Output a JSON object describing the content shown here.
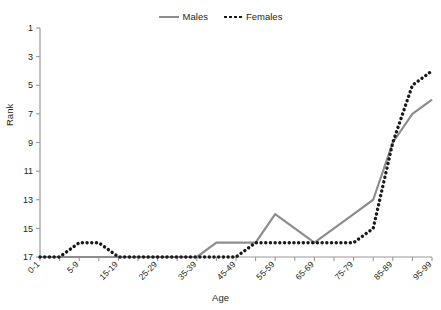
{
  "chart_data": {
    "type": "line",
    "title": "",
    "xlabel": "Age",
    "ylabel": "Rank",
    "y_inverted": true,
    "ylim": [
      1,
      17
    ],
    "y_ticks": [
      1,
      3,
      5,
      7,
      9,
      11,
      13,
      15,
      17
    ],
    "grid": false,
    "legend_position": "top-center",
    "categories": [
      "0-1",
      "1-4",
      "5-9",
      "10-14",
      "15-19",
      "20-24",
      "25-29",
      "30-34",
      "35-39",
      "40-44",
      "45-49",
      "50-54",
      "55-59",
      "60-64",
      "65-69",
      "70-74",
      "75-79",
      "80-84",
      "85-89",
      "90-94",
      "95-99"
    ],
    "x_tick_labels": [
      "0-1",
      "",
      "5-9",
      "",
      "15-19",
      "",
      "25-29",
      "",
      "35-39",
      "",
      "45-49",
      "",
      "55-59",
      "",
      "65-69",
      "",
      "75-79",
      "",
      "85-89",
      "",
      "95-99"
    ],
    "series": [
      {
        "name": "Males",
        "color": "#8d8d8d",
        "style": "solid",
        "values": [
          17,
          17,
          17,
          17,
          17,
          17,
          17,
          17,
          17,
          16,
          16,
          16,
          14,
          15,
          16,
          15,
          14,
          13,
          9,
          7,
          6
        ]
      },
      {
        "name": "Females",
        "color": "#1a1a1a",
        "style": "dotted",
        "values": [
          17,
          17,
          16,
          16,
          17,
          17,
          17,
          17,
          17,
          17,
          17,
          16,
          16,
          16,
          16,
          16,
          16,
          15,
          9,
          5,
          4
        ]
      }
    ]
  },
  "legend": {
    "entries": [
      {
        "label": "Males"
      },
      {
        "label": "Females"
      }
    ]
  },
  "axes": {
    "y_title": "Rank",
    "x_title": "Age"
  },
  "colors": {
    "males": "#8d8d8d",
    "females": "#1a1a1a",
    "axis": "#9a9a9a",
    "text": "#231f20"
  }
}
